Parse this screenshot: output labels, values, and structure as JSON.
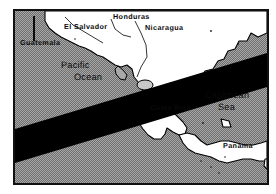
{
  "figure": {
    "type": "map",
    "frame": {
      "border_color": "#111111",
      "background": "#ffffff"
    },
    "ocean": {
      "fill_style": "halftone-gray-dither",
      "base_color": "#a8a8a8",
      "dot_color": "#6e6e6e"
    },
    "land": {
      "fill": "#ffffff",
      "outline": "#000000"
    },
    "eclipse_band": {
      "color": "#000000",
      "description": "dark diagonal band crossing the map from lower-left to upper-right",
      "enters_left_edge_y": [
        118,
        152
      ],
      "exits_right_edge_y": [
        42,
        76
      ]
    }
  },
  "labels": {
    "countries": [
      {
        "name": "guatemala",
        "text": "Guatemala"
      },
      {
        "name": "el-salvador",
        "text": "El Salvador"
      },
      {
        "name": "honduras",
        "text": "Honduras"
      },
      {
        "name": "nicaragua",
        "text": "Nicaragua"
      },
      {
        "name": "costa-rica",
        "text": "Costa Rica"
      },
      {
        "name": "panama",
        "text": "Panama"
      }
    ],
    "water_bodies": [
      {
        "name": "pacific-ocean",
        "line1": "Pacific",
        "line2": "Ocean"
      },
      {
        "name": "caribbean-sea",
        "line1": "Caribbean",
        "line2": "Sea"
      }
    ]
  },
  "annotations": {
    "scale_tick": {
      "name": "scale-tick",
      "label": ""
    }
  }
}
